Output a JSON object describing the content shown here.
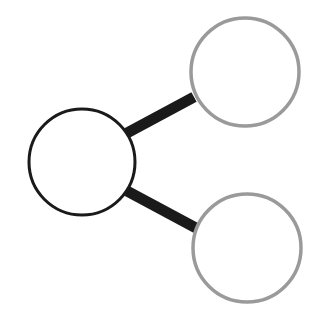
{
  "diagram": {
    "type": "node-link",
    "colors": {
      "background": "#ffffff",
      "root_stroke": "#1a1a1a",
      "child_stroke": "#9a9a9a",
      "edge": "#1a1a1a"
    },
    "nodes": [
      {
        "id": "root",
        "cx": 82,
        "cy": 162,
        "r": 53,
        "stroke_width": 3
      },
      {
        "id": "child-top",
        "cx": 245,
        "cy": 72,
        "r": 54,
        "stroke_width": 3.5
      },
      {
        "id": "child-bottom",
        "cx": 247,
        "cy": 248,
        "r": 54,
        "stroke_width": 3.5
      }
    ],
    "edges": [
      {
        "from": "root",
        "to": "child-top",
        "x1": 127,
        "y1": 133,
        "x2": 194,
        "y2": 97,
        "width": 11
      },
      {
        "from": "root",
        "to": "child-bottom",
        "x1": 127,
        "y1": 191,
        "x2": 196,
        "y2": 228,
        "width": 11
      }
    ]
  }
}
